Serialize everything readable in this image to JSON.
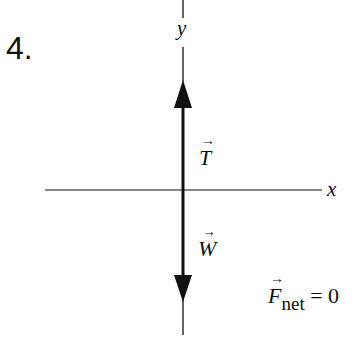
{
  "problem_number": "4.",
  "axes": {
    "x_label": "x",
    "y_label": "y"
  },
  "forces": [
    {
      "name": "T",
      "direction": "up",
      "label": "T"
    },
    {
      "name": "W",
      "direction": "down",
      "label": "W"
    }
  ],
  "net_force": {
    "symbol": "F",
    "subscript": "net",
    "equation_rhs": "= 0"
  },
  "colors": {
    "line": "#111111",
    "background": "#ffffff"
  }
}
